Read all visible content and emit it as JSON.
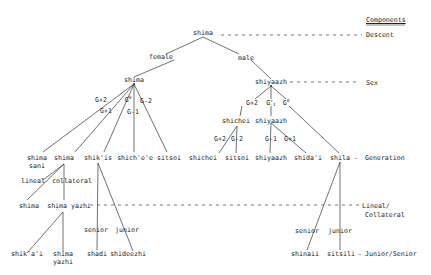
{
  "components": {
    "heading": "Components",
    "levels": [
      "Descent",
      "Sex",
      "Generation",
      "Lineal/",
      "Collateral",
      "Junior/Senior"
    ]
  },
  "tree": {
    "root": "shima",
    "branches": {
      "female": "female",
      "male": "male"
    },
    "female_node": "shima",
    "male_node": "shiyaazh",
    "female_edges": {
      "g_plus_2": "G+2",
      "g_plus_1": "G+1",
      "g_zero": "G",
      "g_zero_sup": "0",
      "g_minus_1": "G-1",
      "g_minus_2": "G-2"
    },
    "male_edges": {
      "g_plus_2": "G+2",
      "g_pm_1": "G",
      "g_pm_1_sup": "+",
      "g_pm_1_sub": "-1",
      "g_zero": "G",
      "g_zero_sup": "0"
    },
    "male_sub": {
      "shichei": "shichei",
      "shichei_g_plus_2": "G+2",
      "shichei_g_minus_2": "G-2",
      "shiyaazh": "shiyaazh",
      "shiyaazh_g_minus_1": "G-1",
      "shiyaazh_g_plus_1": "G+1"
    },
    "generation_row": {
      "shima_sani_1": "shima",
      "shima_sani_2": "sani",
      "shima": "shima",
      "shikis": "shik'is",
      "shichee": "shich'e'e",
      "sitsoi_f": "sitsoi",
      "shichei": "shichei",
      "sitsoi_m": "sitsoi",
      "shiyaazh": "shiyaazh",
      "shidai": "shida'i",
      "shila": "shila",
      "dash": "-"
    },
    "lineal_collateral": {
      "lineal": "lineal",
      "collateral": "collateral",
      "shima": "shima",
      "shima_yazhi": "shima yazhi"
    },
    "junior_senior": {
      "left_senior": "senior",
      "left_junior": "junior",
      "right_senior": "senior",
      "right_junior": "junior",
      "shikai": "shik'a'i",
      "shima_yazhi_1": "shima",
      "shima_yazhi_2": "yazhi",
      "shadi": "shadi",
      "shideezhi": "shideezhi",
      "shinaii": "shinaii",
      "sitsili": "sitsili",
      "dash": "-"
    }
  },
  "colors": {
    "line": "#333333",
    "text": "#222222",
    "background": "#ffffff"
  }
}
